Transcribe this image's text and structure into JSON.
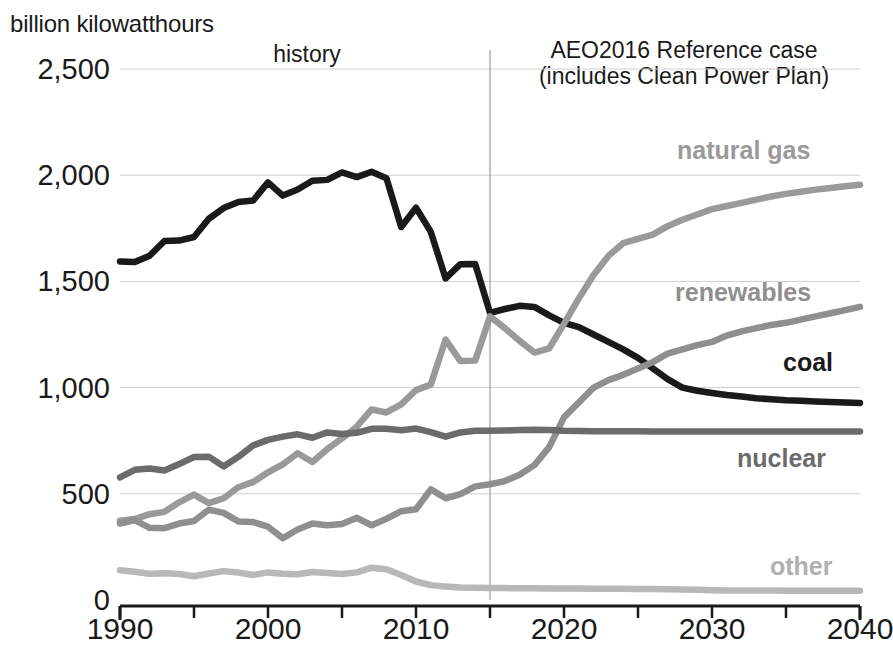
{
  "axis_unit": "billion kilowatthours",
  "annotations": {
    "history": "history",
    "projection_line1": "AEO2016 Reference case",
    "projection_line2": "(includes Clean Power Plan)"
  },
  "series_labels": {
    "natural_gas": "natural gas",
    "renewables": "renewables",
    "coal": "coal",
    "nuclear": "nuclear",
    "other": "other"
  },
  "colors": {
    "coal": "#1a1a1a",
    "nuclear": "#6b6b6b",
    "natural_gas": "#9a9a9a",
    "renewables": "#8f8f8f",
    "other": "#b8b8b8",
    "gridline": "#cfcfcf",
    "divider": "#9a9a9a",
    "axis": "#1a1a1a"
  },
  "chart_data": {
    "type": "line",
    "title": "",
    "subtitle": "billion kilowatthours",
    "xlabel": "",
    "ylabel": "billion kilowatthours",
    "xlim": [
      1990,
      2040
    ],
    "ylim": [
      0,
      2500
    ],
    "xticks": [
      1990,
      2000,
      2010,
      2020,
      2030,
      2040
    ],
    "xtick_labels": [
      "1990",
      "2000",
      "2010",
      "2020",
      "2030",
      "2040"
    ],
    "xminor_ticks": [
      1995,
      2005,
      2015,
      2025,
      2035
    ],
    "yticks": [
      0,
      500,
      1000,
      1500,
      2000,
      2500
    ],
    "ytick_labels": [
      "0",
      "500",
      "1,000",
      "1,500",
      "2,000",
      "2,500"
    ],
    "grid": true,
    "grid_axis": "y",
    "legend": "inline-right-labels",
    "history_projection_split": 2015,
    "x": [
      1990,
      1991,
      1992,
      1993,
      1994,
      1995,
      1996,
      1997,
      1998,
      1999,
      2000,
      2001,
      2002,
      2003,
      2004,
      2005,
      2006,
      2007,
      2008,
      2009,
      2010,
      2011,
      2012,
      2013,
      2014,
      2015,
      2016,
      2017,
      2018,
      2019,
      2020,
      2021,
      2022,
      2023,
      2024,
      2025,
      2026,
      2027,
      2028,
      2029,
      2030,
      2031,
      2032,
      2033,
      2034,
      2035,
      2036,
      2037,
      2038,
      2039,
      2040
    ],
    "series": [
      {
        "name": "coal",
        "color": "#1a1a1a",
        "values": [
          1594,
          1591,
          1621,
          1690,
          1692,
          1709,
          1795,
          1845,
          1874,
          1881,
          1966,
          1904,
          1933,
          1974,
          1978,
          2013,
          1991,
          2016,
          1986,
          1756,
          1847,
          1733,
          1514,
          1581,
          1582,
          1352,
          1370,
          1385,
          1380,
          1340,
          1305,
          1285,
          1250,
          1215,
          1180,
          1140,
          1090,
          1040,
          1000,
          985,
          975,
          965,
          958,
          950,
          945,
          940,
          938,
          935,
          932,
          930,
          928
        ]
      },
      {
        "name": "natural gas",
        "color": "#9a9a9a",
        "values": [
          373,
          381,
          404,
          415,
          460,
          496,
          456,
          479,
          531,
          556,
          601,
          639,
          691,
          650,
          710,
          761,
          816,
          897,
          883,
          921,
          988,
          1014,
          1226,
          1125,
          1127,
          1335,
          1280,
          1220,
          1165,
          1185,
          1300,
          1420,
          1530,
          1620,
          1680,
          1700,
          1720,
          1760,
          1790,
          1815,
          1840,
          1855,
          1870,
          1885,
          1900,
          1912,
          1922,
          1932,
          1940,
          1948,
          1955
        ]
      },
      {
        "name": "renewables",
        "color": "#8f8f8f",
        "values": [
          360,
          376,
          340,
          338,
          360,
          372,
          425,
          410,
          370,
          367,
          345,
          291,
          332,
          360,
          352,
          358,
          387,
          352,
          382,
          418,
          427,
          521,
          479,
          498,
          535,
          545,
          560,
          590,
          635,
          720,
          860,
          930,
          1000,
          1035,
          1060,
          1090,
          1120,
          1160,
          1180,
          1200,
          1215,
          1245,
          1265,
          1280,
          1295,
          1305,
          1320,
          1335,
          1350,
          1365,
          1380
        ]
      },
      {
        "name": "nuclear",
        "color": "#6b6b6b",
        "values": [
          577,
          613,
          619,
          610,
          640,
          673,
          675,
          629,
          674,
          728,
          754,
          769,
          780,
          764,
          789,
          782,
          787,
          806,
          806,
          799,
          807,
          790,
          769,
          789,
          797,
          797,
          798,
          800,
          802,
          800,
          797,
          796,
          795,
          795,
          794,
          794,
          793,
          793,
          793,
          793,
          793,
          793,
          793,
          793,
          793,
          793,
          793,
          793,
          793,
          793,
          793
        ]
      },
      {
        "name": "other",
        "color": "#b8b8b8",
        "values": [
          140,
          133,
          124,
          126,
          122,
          112,
          125,
          136,
          129,
          118,
          130,
          124,
          121,
          132,
          127,
          122,
          130,
          152,
          145,
          118,
          87,
          70,
          63,
          59,
          58,
          57,
          56,
          55,
          55,
          54,
          54,
          54,
          53,
          53,
          53,
          52,
          52,
          51,
          50,
          48,
          46,
          45,
          45,
          45,
          45,
          44,
          44,
          44,
          44,
          43,
          43
        ]
      }
    ]
  }
}
